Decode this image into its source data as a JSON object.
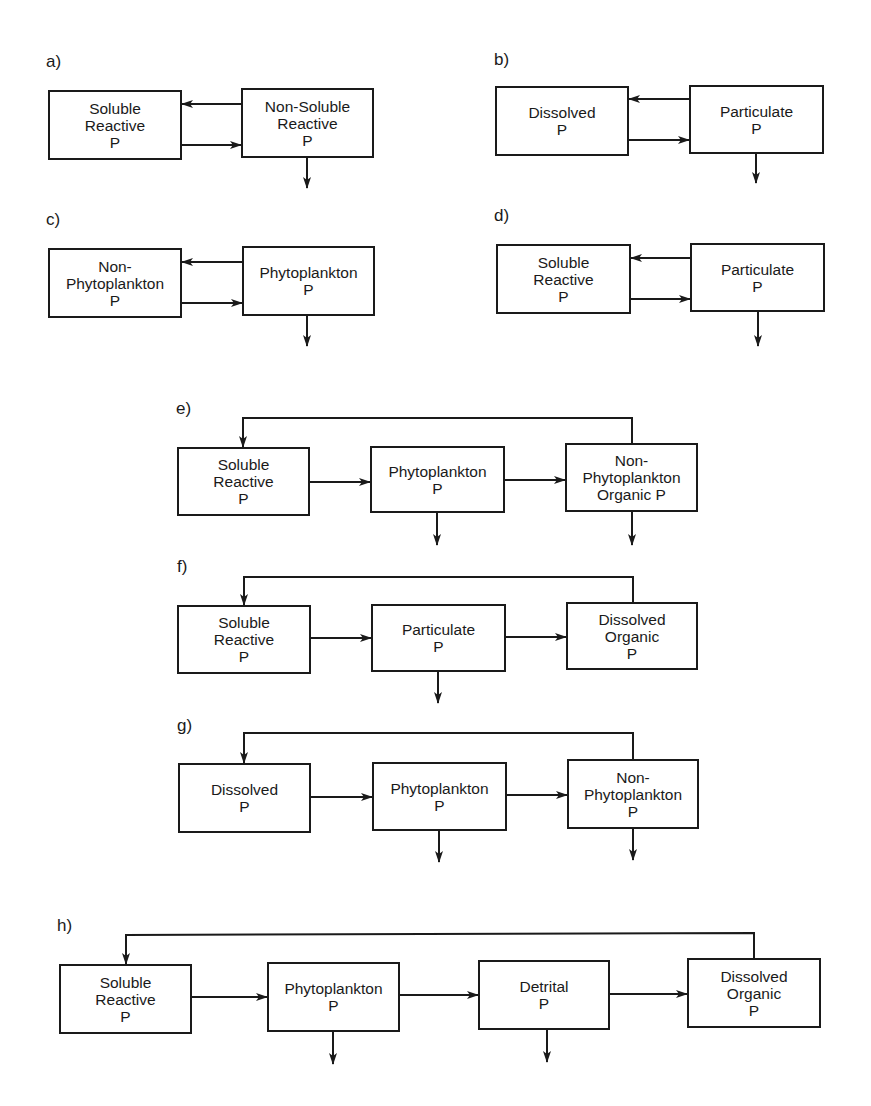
{
  "figure": {
    "line_color": "#1a1a1a",
    "background": "#ffffff"
  },
  "panels": [
    {
      "id": "a",
      "label": "a)",
      "label_pos": [
        46,
        53
      ],
      "boxes": [
        {
          "lines": [
            "Soluble",
            "Reactive",
            "P"
          ],
          "x": 48,
          "y": 90,
          "w": 134,
          "h": 70
        },
        {
          "lines": [
            "Non-Soluble",
            "Reactive",
            "P"
          ],
          "x": 241,
          "y": 88,
          "w": 133,
          "h": 70
        }
      ],
      "arrows": [
        {
          "from": [
            241,
            104
          ],
          "to": [
            182,
            104
          ]
        },
        {
          "from": [
            182,
            145
          ],
          "to": [
            241,
            145
          ]
        },
        {
          "from": [
            307,
            158
          ],
          "to": [
            307,
            188
          ]
        }
      ]
    },
    {
      "id": "b",
      "label": "b)",
      "label_pos": [
        494,
        51
      ],
      "boxes": [
        {
          "lines": [
            "Dissolved",
            "P"
          ],
          "x": 495,
          "y": 86,
          "w": 134,
          "h": 70
        },
        {
          "lines": [
            "Particulate",
            "P"
          ],
          "x": 689,
          "y": 85,
          "w": 135,
          "h": 69
        }
      ],
      "arrows": [
        {
          "from": [
            689,
            99
          ],
          "to": [
            629,
            99
          ]
        },
        {
          "from": [
            629,
            140
          ],
          "to": [
            689,
            140
          ]
        },
        {
          "from": [
            756,
            154
          ],
          "to": [
            756,
            183
          ]
        }
      ]
    },
    {
      "id": "c",
      "label": "c)",
      "label_pos": [
        46,
        211
      ],
      "boxes": [
        {
          "lines": [
            "Non-",
            "Phytoplankton",
            "P"
          ],
          "x": 48,
          "y": 248,
          "w": 134,
          "h": 70
        },
        {
          "lines": [
            "Phytoplankton",
            "P"
          ],
          "x": 242,
          "y": 246,
          "w": 133,
          "h": 70
        }
      ],
      "arrows": [
        {
          "from": [
            242,
            262
          ],
          "to": [
            182,
            262
          ]
        },
        {
          "from": [
            182,
            303
          ],
          "to": [
            242,
            303
          ]
        },
        {
          "from": [
            307,
            316
          ],
          "to": [
            307,
            346
          ]
        }
      ]
    },
    {
      "id": "d",
      "label": "d)",
      "label_pos": [
        494,
        207
      ],
      "boxes": [
        {
          "lines": [
            "Soluble",
            "Reactive",
            "P"
          ],
          "x": 496,
          "y": 244,
          "w": 135,
          "h": 70
        },
        {
          "lines": [
            "Particulate",
            "P"
          ],
          "x": 690,
          "y": 243,
          "w": 135,
          "h": 69
        }
      ],
      "arrows": [
        {
          "from": [
            690,
            258
          ],
          "to": [
            631,
            258
          ]
        },
        {
          "from": [
            631,
            299
          ],
          "to": [
            690,
            299
          ]
        },
        {
          "from": [
            758,
            312
          ],
          "to": [
            758,
            346
          ]
        }
      ]
    },
    {
      "id": "e",
      "label": "e)",
      "label_pos": [
        176,
        400
      ],
      "boxes": [
        {
          "lines": [
            "Soluble",
            "Reactive",
            "P"
          ],
          "x": 177,
          "y": 447,
          "w": 133,
          "h": 69
        },
        {
          "lines": [
            "Phytoplankton",
            "P"
          ],
          "x": 370,
          "y": 446,
          "w": 135,
          "h": 67
        },
        {
          "lines": [
            "Non-",
            "Phytoplankton",
            "Organic P"
          ],
          "x": 565,
          "y": 443,
          "w": 133,
          "h": 69
        }
      ],
      "arrows": [
        {
          "from": [
            310,
            482
          ],
          "to": [
            370,
            482
          ]
        },
        {
          "from": [
            505,
            480
          ],
          "to": [
            565,
            480
          ]
        },
        {
          "from": [
            437,
            513
          ],
          "to": [
            437,
            545
          ]
        },
        {
          "from": [
            632,
            512
          ],
          "to": [
            632,
            545
          ]
        }
      ],
      "feedback": {
        "points": [
          [
            632,
            443
          ],
          [
            632,
            418
          ],
          [
            243,
            418
          ]
        ],
        "to": [
          243,
          447
        ]
      }
    },
    {
      "id": "f",
      "label": "f)",
      "label_pos": [
        177,
        558
      ],
      "boxes": [
        {
          "lines": [
            "Soluble",
            "Reactive",
            "P"
          ],
          "x": 177,
          "y": 605,
          "w": 134,
          "h": 69
        },
        {
          "lines": [
            "Particulate",
            "P"
          ],
          "x": 371,
          "y": 604,
          "w": 135,
          "h": 68
        },
        {
          "lines": [
            "Dissolved",
            "Organic",
            "P"
          ],
          "x": 566,
          "y": 602,
          "w": 132,
          "h": 68
        }
      ],
      "arrows": [
        {
          "from": [
            311,
            638
          ],
          "to": [
            371,
            638
          ]
        },
        {
          "from": [
            506,
            637
          ],
          "to": [
            566,
            637
          ]
        },
        {
          "from": [
            438,
            672
          ],
          "to": [
            438,
            703
          ]
        }
      ],
      "feedback": {
        "points": [
          [
            633,
            602
          ],
          [
            633,
            577
          ],
          [
            244,
            577
          ]
        ],
        "to": [
          244,
          605
        ]
      }
    },
    {
      "id": "g",
      "label": "g)",
      "label_pos": [
        177,
        717
      ],
      "boxes": [
        {
          "lines": [
            "Dissolved",
            "P"
          ],
          "x": 178,
          "y": 763,
          "w": 133,
          "h": 70
        },
        {
          "lines": [
            "Phytoplankton",
            "P"
          ],
          "x": 372,
          "y": 762,
          "w": 135,
          "h": 69
        },
        {
          "lines": [
            "Non-",
            "Phytoplankton",
            "P"
          ],
          "x": 567,
          "y": 759,
          "w": 132,
          "h": 70
        }
      ],
      "arrows": [
        {
          "from": [
            311,
            797
          ],
          "to": [
            372,
            797
          ]
        },
        {
          "from": [
            507,
            795
          ],
          "to": [
            567,
            795
          ]
        },
        {
          "from": [
            439,
            831
          ],
          "to": [
            439,
            862
          ]
        },
        {
          "from": [
            633,
            829
          ],
          "to": [
            633,
            860
          ]
        }
      ],
      "feedback": {
        "points": [
          [
            633,
            759
          ],
          [
            633,
            733
          ],
          [
            244,
            733
          ]
        ],
        "to": [
          244,
          763
        ]
      }
    },
    {
      "id": "h",
      "label": "h)",
      "label_pos": [
        57,
        917
      ],
      "boxes": [
        {
          "lines": [
            "Soluble",
            "Reactive",
            "P"
          ],
          "x": 59,
          "y": 964,
          "w": 133,
          "h": 70
        },
        {
          "lines": [
            "Phytoplankton",
            "P"
          ],
          "x": 267,
          "y": 962,
          "w": 133,
          "h": 70
        },
        {
          "lines": [
            "Detrital",
            "P"
          ],
          "x": 478,
          "y": 960,
          "w": 132,
          "h": 70
        },
        {
          "lines": [
            "Dissolved",
            "Organic",
            "P"
          ],
          "x": 687,
          "y": 958,
          "w": 134,
          "h": 70
        }
      ],
      "arrows": [
        {
          "from": [
            192,
            997
          ],
          "to": [
            267,
            997
          ]
        },
        {
          "from": [
            400,
            995
          ],
          "to": [
            478,
            995
          ]
        },
        {
          "from": [
            610,
            994
          ],
          "to": [
            687,
            994
          ]
        },
        {
          "from": [
            333,
            1032
          ],
          "to": [
            333,
            1064
          ]
        },
        {
          "from": [
            547,
            1030
          ],
          "to": [
            547,
            1062
          ]
        }
      ],
      "feedback": {
        "points": [
          [
            754,
            958
          ],
          [
            754,
            933
          ],
          [
            126,
            935
          ]
        ],
        "to": [
          126,
          964
        ]
      }
    }
  ],
  "caption_clipped": {
    "visible": true,
    "note": "Text line cut off at bottom edge; only ascender tops visible",
    "segments": [
      [
        200,
        10
      ],
      [
        260,
        6
      ],
      [
        300,
        8
      ],
      [
        380,
        12
      ],
      [
        460,
        6
      ],
      [
        520,
        10
      ],
      [
        600,
        14
      ],
      [
        700,
        8
      ],
      [
        760,
        10
      ],
      [
        820,
        6
      ]
    ]
  }
}
